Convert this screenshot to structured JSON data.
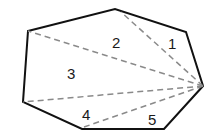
{
  "diagram": {
    "shape": "heptagon",
    "vertices": [
      {
        "id": "A",
        "x": 28,
        "y": 31
      },
      {
        "id": "B",
        "x": 115,
        "y": 9
      },
      {
        "id": "C",
        "x": 186,
        "y": 32
      },
      {
        "id": "D",
        "x": 204,
        "y": 86
      },
      {
        "id": "E",
        "x": 164,
        "y": 129
      },
      {
        "id": "F",
        "x": 82,
        "y": 129
      },
      {
        "id": "G",
        "x": 23,
        "y": 102
      }
    ],
    "diagonals_from": "D",
    "diagonals_to": [
      "B",
      "A",
      "G",
      "F"
    ],
    "outline_color": "#111111",
    "diagonal_color": "#8a8a8a",
    "triangle_labels": [
      {
        "text": "1",
        "x": 174,
        "y": 48
      },
      {
        "text": "2",
        "x": 118,
        "y": 47
      },
      {
        "text": "3",
        "x": 72,
        "y": 78
      },
      {
        "text": "4",
        "x": 86,
        "y": 119
      },
      {
        "text": "5",
        "x": 153,
        "y": 124
      }
    ]
  }
}
